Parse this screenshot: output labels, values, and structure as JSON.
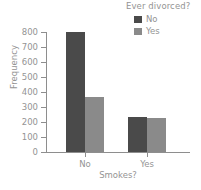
{
  "chart_data": {
    "type": "bar",
    "title": "",
    "subtitle": "",
    "xlabel": "Smokes?",
    "ylabel": "Frequency",
    "categories": [
      "No",
      "Yes"
    ],
    "series": [
      {
        "name": "No",
        "values": [
          797,
          233
        ],
        "color": "#4a4a4a"
      },
      {
        "name": "Yes",
        "values": [
          367,
          227
        ],
        "color": "#8a8a8a"
      }
    ],
    "legend": {
      "title": "Ever divorced?",
      "position": "top-right",
      "entries": [
        {
          "label": "No",
          "color": "#4a4a4a"
        },
        {
          "label": "Yes",
          "color": "#8a8a8a"
        }
      ]
    },
    "ylim": [
      0,
      800
    ],
    "yticks": [
      800,
      700,
      600,
      500,
      400,
      300,
      200,
      100,
      0
    ],
    "ytick_labels": [
      "800",
      "700",
      "600",
      "500",
      "400",
      "300",
      "200",
      "100",
      "0"
    ],
    "xtick_labels": [
      "No",
      "Yes"
    ],
    "grid": false,
    "axis_color": "#8e8e8e",
    "text_color": "#949494",
    "background": "#ffffff"
  }
}
